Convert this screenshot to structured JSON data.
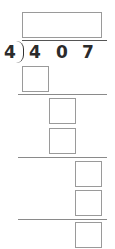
{
  "problem": {
    "divisor": "4",
    "dividend_digits": [
      "4",
      "0",
      "7"
    ]
  },
  "answer_box": {
    "value": ""
  },
  "work_steps": [
    {
      "boxes": [
        ""
      ]
    },
    {
      "boxes": [
        "",
        ""
      ]
    },
    {
      "boxes": [
        "",
        ""
      ]
    },
    {
      "boxes": [
        ""
      ]
    }
  ]
}
